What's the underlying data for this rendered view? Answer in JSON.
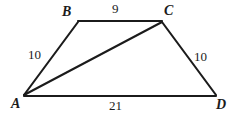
{
  "figure": {
    "type": "trapezoid-with-diagonal",
    "background_color": "#ffffff",
    "stroke_color": "#1b1b1b",
    "vertices": [
      {
        "name": "A",
        "label": "A",
        "x": 24,
        "y": 95
      },
      {
        "name": "B",
        "label": "B",
        "x": 78,
        "y": 22
      },
      {
        "name": "C",
        "label": "C",
        "x": 162,
        "y": 22
      },
      {
        "name": "D",
        "label": "D",
        "x": 216,
        "y": 95
      }
    ],
    "edges": [
      {
        "name": "AB",
        "from": "A",
        "to": "B",
        "length_label": "10"
      },
      {
        "name": "BC",
        "from": "B",
        "to": "C",
        "length_label": "9"
      },
      {
        "name": "CD",
        "from": "C",
        "to": "D",
        "length_label": "10"
      },
      {
        "name": "AD",
        "from": "A",
        "to": "D",
        "length_label": "21"
      },
      {
        "name": "AC",
        "from": "A",
        "to": "C",
        "length_label": ""
      }
    ],
    "labels": {
      "A": "A",
      "B": "B",
      "C": "C",
      "D": "D",
      "AB": "10",
      "BC": "9",
      "CD": "10",
      "AD": "21"
    }
  }
}
